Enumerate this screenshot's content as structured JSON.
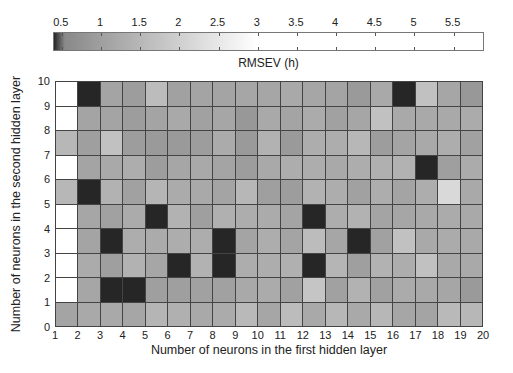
{
  "chart_data": {
    "type": "heatmap",
    "title": "",
    "colorbar": {
      "label": "RMSEV (h)",
      "ticks": [
        "0.5",
        "1",
        "1.5",
        "2",
        "2.5",
        "3",
        "3.5",
        "4",
        "4.5",
        "5",
        "5.5"
      ],
      "range": [
        0.4,
        5.9
      ],
      "colormap": "gray (dark at low values, white at >= 3)"
    },
    "xlabel": "Number of neurons in the first hidden layer",
    "ylabel": "Number of neurons in the second hidden layer",
    "x_ticks": [
      "1",
      "2",
      "3",
      "4",
      "5",
      "6",
      "7",
      "8",
      "9",
      "10",
      "11",
      "12",
      "13",
      "14",
      "15",
      "16",
      "17",
      "18",
      "19",
      "20"
    ],
    "y_ticks": [
      "0",
      "1",
      "2",
      "3",
      "4",
      "5",
      "6",
      "7",
      "8",
      "9",
      "10"
    ],
    "xlim": [
      1,
      20
    ],
    "ylim": [
      0,
      10
    ],
    "grid": true,
    "row_order": "top-to-bottom (y 9-10 first, y 0-1 last)",
    "values": [
      [
        6.0,
        0.4,
        1.1,
        0.95,
        1.6,
        1.05,
        1.1,
        1.1,
        1.15,
        1.15,
        1.2,
        1.15,
        1.1,
        0.9,
        1.2,
        0.4,
        1.7,
        1.15,
        0.85
      ],
      [
        6.0,
        1.1,
        1.1,
        0.95,
        1.1,
        1.2,
        1.05,
        1.15,
        0.85,
        1.2,
        1.1,
        1.25,
        1.05,
        1.15,
        1.7,
        1.2,
        1.2,
        1.2,
        1.25
      ],
      [
        1.5,
        1.0,
        1.7,
        0.95,
        0.9,
        0.9,
        0.95,
        1.25,
        0.9,
        1.4,
        0.9,
        1.3,
        1.3,
        1.5,
        0.95,
        1.1,
        1.2,
        1.3,
        1.05
      ],
      [
        6.0,
        1.1,
        1.2,
        1.3,
        0.95,
        1.15,
        1.2,
        1.1,
        0.95,
        1.2,
        1.3,
        1.3,
        1.2,
        1.3,
        1.35,
        1.4,
        0.4,
        1.0,
        1.25
      ],
      [
        1.5,
        0.4,
        1.4,
        1.05,
        1.45,
        1.25,
        1.2,
        1.1,
        1.5,
        1.0,
        0.95,
        1.4,
        1.3,
        1.05,
        1.3,
        1.1,
        1.3,
        2.2,
        1.2
      ],
      [
        6.0,
        1.15,
        1.05,
        1.25,
        0.4,
        1.4,
        1.0,
        1.35,
        1.3,
        1.25,
        1.1,
        0.4,
        1.3,
        1.4,
        1.1,
        1.15,
        1.2,
        1.25,
        1.2
      ],
      [
        6.0,
        1.1,
        0.4,
        1.3,
        1.25,
        1.3,
        1.3,
        0.4,
        1.1,
        1.3,
        1.1,
        1.6,
        1.15,
        0.4,
        1.05,
        1.7,
        1.2,
        1.25,
        1.2
      ],
      [
        6.0,
        1.25,
        1.0,
        1.4,
        1.15,
        0.4,
        1.4,
        0.4,
        1.3,
        1.3,
        1.35,
        0.4,
        1.45,
        1.0,
        1.4,
        1.3,
        1.7,
        1.2,
        1.2
      ],
      [
        6.0,
        1.15,
        0.4,
        0.4,
        1.0,
        1.0,
        1.05,
        1.05,
        1.2,
        1.25,
        1.05,
        1.8,
        1.05,
        1.4,
        1.05,
        1.25,
        1.2,
        1.15,
        0.9
      ],
      [
        1.1,
        1.2,
        1.2,
        1.15,
        1.45,
        1.35,
        1.2,
        1.25,
        1.55,
        1.15,
        1.6,
        1.2,
        1.5,
        1.2,
        1.5,
        1.15,
        1.1,
        1.55,
        1.5
      ]
    ]
  }
}
